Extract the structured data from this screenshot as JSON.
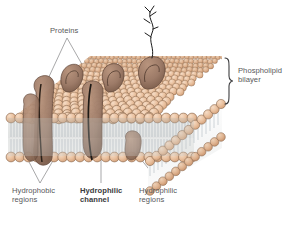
{
  "figure": {
    "background_color": "#ffffff",
    "palette": {
      "head_fill": "#e7bd9b",
      "head_fill_light": "#f0cdb0",
      "head_fill_shadow": "#d9a780",
      "head_stroke": "#8a6a50",
      "protein_fill": "#9d7b68",
      "protein_fill_light": "#b08d78",
      "protein_stroke": "#5d4436",
      "tail_color": "#9aa6ae",
      "interior_fill": "#ffffff",
      "interior_shade": "#c9ccc9",
      "leader_line": "#6d6d6f",
      "label_text": "#58585a",
      "carb_chain": "#1c1c1c"
    }
  },
  "labels": {
    "proteins": "Proteins",
    "bilayer": "Phospholipid\nbilayer",
    "hydrophobic_regions": "Hydrophobic\nregions",
    "hydrophilic_channel": "Hydrophilic\nchannel",
    "hydrophilic_regions": "Hydrophilic\nregions"
  },
  "parts": {
    "top_surface": "phospholipid-head-mosaic-top",
    "front_cross_section": "bilayer-cross-section-front",
    "right_cross_section": "bilayer-cross-section-right",
    "brace": "phospholipid-bilayer-brace",
    "carbohydrate_chain": "branched-carbohydrate-chain",
    "proteins_count": 8
  }
}
